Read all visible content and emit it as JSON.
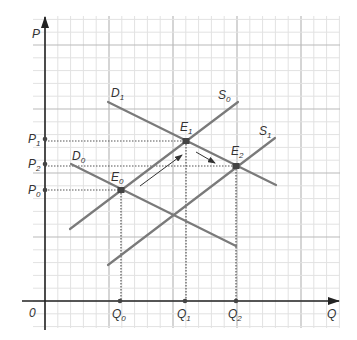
{
  "diagram": {
    "title": "",
    "type": "supply-demand",
    "axes": {
      "x_label": "Q",
      "y_label": "P",
      "origin_label": "0"
    },
    "colors": {
      "curve": "#7a7a7a",
      "axis": "#222222",
      "grid_minor": "#e2e2e2",
      "grid_major": "#b9b9b9",
      "guide": "#555555",
      "point": "#444444",
      "text": "#333333"
    },
    "curves": [
      {
        "name": "D0",
        "base": "D",
        "sub": "0",
        "kind": "demand",
        "from": [
          71,
          164
        ],
        "to": [
          236,
          246
        ],
        "label_pos": [
          72,
          160
        ]
      },
      {
        "name": "D1",
        "base": "D",
        "sub": "1",
        "kind": "demand",
        "from": [
          108,
          102
        ],
        "to": [
          276,
          185
        ],
        "label_pos": [
          111,
          97
        ]
      },
      {
        "name": "S0",
        "base": "S",
        "sub": "0",
        "kind": "supply",
        "from": [
          70,
          229
        ],
        "to": [
          238,
          102
        ],
        "label_pos": [
          218,
          99
        ]
      },
      {
        "name": "S1",
        "base": "S",
        "sub": "1",
        "kind": "supply",
        "from": [
          108,
          265
        ],
        "to": [
          275,
          138
        ],
        "label_pos": [
          259,
          135
        ]
      }
    ],
    "equilibria": [
      {
        "name": "E0",
        "base": "E",
        "sub": "0",
        "x": 121,
        "y": 190,
        "label_pos": [
          111,
          181
        ]
      },
      {
        "name": "E1",
        "base": "E",
        "sub": "1",
        "x": 186,
        "y": 141,
        "label_pos": [
          180,
          131
        ]
      },
      {
        "name": "E2",
        "base": "E",
        "sub": "2",
        "x": 236,
        "y": 166,
        "label_pos": [
          231,
          155
        ]
      }
    ],
    "price_ticks": [
      {
        "base": "P",
        "sub": "1",
        "y": 139
      },
      {
        "base": "P",
        "sub": "2",
        "y": 164
      },
      {
        "base": "P",
        "sub": "0",
        "y": 190
      }
    ],
    "quantity_ticks": [
      {
        "base": "Q",
        "sub": "0",
        "x": 120
      },
      {
        "base": "Q",
        "sub": "1",
        "x": 185
      },
      {
        "base": "Q",
        "sub": "2",
        "x": 236
      }
    ],
    "arrows": [
      {
        "name": "shift-arrow-along-s0",
        "from": [
          140,
          186
        ],
        "to": [
          182,
          155
        ]
      },
      {
        "name": "shift-arrow-along-d1",
        "from": [
          196,
          152
        ],
        "to": [
          215,
          163
        ]
      }
    ],
    "grid": {
      "left": 33,
      "top": 16,
      "right": 340,
      "bottom": 328,
      "origin_x": 45,
      "origin_y": 301,
      "minor_step": 12.8,
      "major_every": 5
    }
  }
}
